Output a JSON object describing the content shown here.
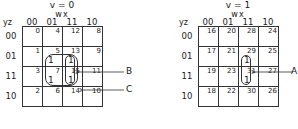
{
  "maps": [
    {
      "title": "v = 0",
      "col_var": "wx",
      "row_var": "yz",
      "col_headers": [
        "00",
        "01",
        "11",
        "10"
      ],
      "row_headers": [
        "00",
        "01",
        "11",
        "10"
      ],
      "cells": [
        [
          {
            "idx": "0",
            "val": ""
          },
          {
            "idx": "4",
            "val": ""
          },
          {
            "idx": "12",
            "val": ""
          },
          {
            "idx": "8",
            "val": ""
          }
        ],
        [
          {
            "idx": "1",
            "val": ""
          },
          {
            "idx": "5",
            "val": "1"
          },
          {
            "idx": "13",
            "val": "1"
          },
          {
            "idx": "9",
            "val": ""
          }
        ],
        [
          {
            "idx": "3",
            "val": ""
          },
          {
            "idx": "7",
            "val": "1"
          },
          {
            "idx": "15",
            "val": "1"
          },
          {
            "idx": "11",
            "val": ""
          }
        ],
        [
          {
            "idx": "2",
            "val": ""
          },
          {
            "idx": "6",
            "val": ""
          },
          {
            "idx": "14",
            "val": ""
          },
          {
            "idx": "10",
            "val": ""
          }
        ]
      ],
      "labels": [
        "B",
        "C"
      ]
    },
    {
      "title": "v = 1",
      "col_var": "wx",
      "row_var": "yz",
      "col_headers": [
        "00",
        "01",
        "11",
        "10"
      ],
      "row_headers": [
        "00",
        "01",
        "11",
        "10"
      ],
      "cells": [
        [
          {
            "idx": "16",
            "val": ""
          },
          {
            "idx": "20",
            "val": ""
          },
          {
            "idx": "28",
            "val": ""
          },
          {
            "idx": "24",
            "val": ""
          }
        ],
        [
          {
            "idx": "17",
            "val": ""
          },
          {
            "idx": "21",
            "val": ""
          },
          {
            "idx": "29",
            "val": "1"
          },
          {
            "idx": "25",
            "val": ""
          }
        ],
        [
          {
            "idx": "19",
            "val": ""
          },
          {
            "idx": "23",
            "val": ""
          },
          {
            "idx": "31",
            "val": "1"
          },
          {
            "idx": "27",
            "val": ""
          }
        ],
        [
          {
            "idx": "18",
            "val": ""
          },
          {
            "idx": "22",
            "val": ""
          },
          {
            "idx": "30",
            "val": ""
          },
          {
            "idx": "26",
            "val": ""
          }
        ]
      ],
      "labels": [
        "A"
      ]
    }
  ]
}
